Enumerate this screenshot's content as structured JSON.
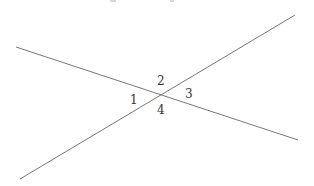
{
  "diagram": {
    "type": "intersecting-lines",
    "line_color": "#777777",
    "label_color": "#333333",
    "lines": [
      {
        "name": "line-a",
        "x1": 16,
        "y1": 47,
        "x2": 298,
        "y2": 140
      },
      {
        "name": "line-b",
        "x1": 20,
        "y1": 179,
        "x2": 295,
        "y2": 15
      }
    ],
    "intersection": {
      "x": 161,
      "y": 95
    },
    "angle_labels": [
      {
        "text": "1",
        "x": 130,
        "y": 94
      },
      {
        "text": "2",
        "x": 157,
        "y": 75
      },
      {
        "text": "3",
        "x": 185,
        "y": 88
      },
      {
        "text": "4",
        "x": 157,
        "y": 104
      }
    ]
  }
}
